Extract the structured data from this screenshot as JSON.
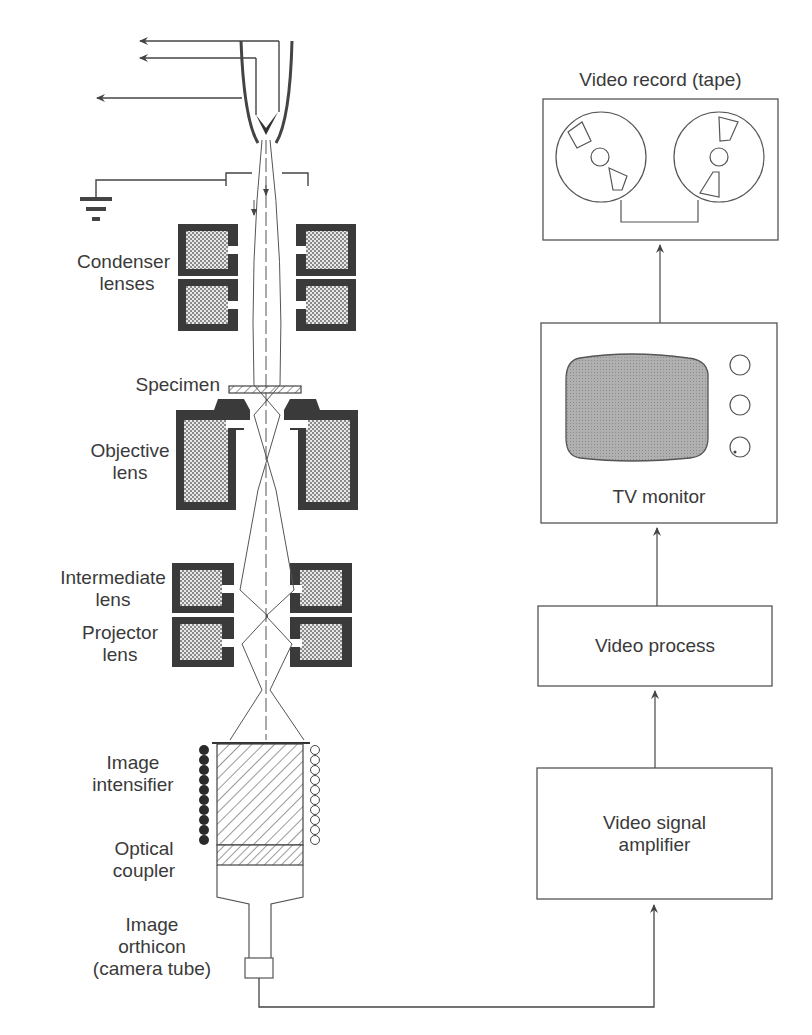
{
  "microscope_labels": {
    "condenser": [
      "Condenser",
      "lenses"
    ],
    "specimen": "Specimen",
    "objective": [
      "Objective",
      "lens"
    ],
    "intermediate": [
      "Intermediate",
      "lens"
    ],
    "projector": [
      "Projector",
      "lens"
    ],
    "intensifier": [
      "Image",
      "intensifier"
    ],
    "coupler": [
      "Optical",
      "coupler"
    ],
    "orthicon": [
      "Image",
      "orthicon",
      "(camera tube)"
    ]
  },
  "video_chain": {
    "record": "Video record (tape)",
    "monitor": "TV monitor",
    "process": "Video process",
    "amplifier": [
      "Video signal",
      "amplifier"
    ]
  },
  "flow": [
    "Image orthicon (camera tube)",
    "Video signal amplifier",
    "Video process",
    "TV monitor",
    "Video record (tape)"
  ],
  "colors": {
    "line": "#4a4a4a",
    "coil": "#3a3a3a",
    "fill": "#bdbdbd",
    "screen": "#a8a8a8"
  }
}
